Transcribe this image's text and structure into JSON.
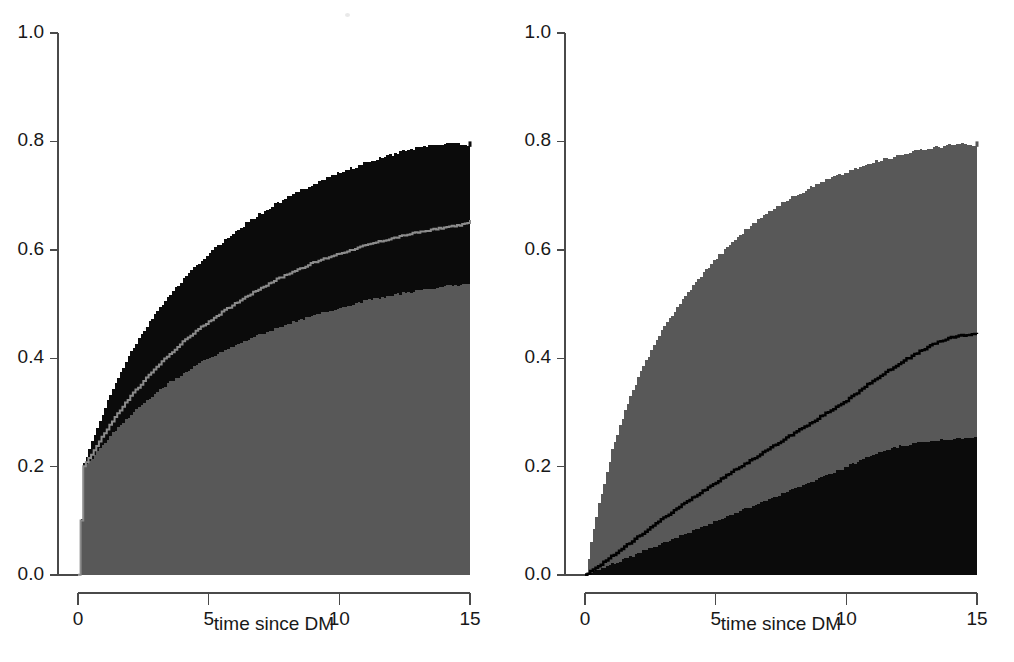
{
  "figure": {
    "width": 1014,
    "height": 662,
    "background": "#ffffff",
    "panel_count": 2
  },
  "colors": {
    "gray_fill": "#585858",
    "black_fill": "#0b0b0b",
    "light_line": "#8c8c8c",
    "dark_line": "#000000",
    "axis": "#4a4a4a",
    "text": "#181818",
    "page": "#ffffff"
  },
  "axes": {
    "y": {
      "label": "",
      "min": 0.0,
      "max": 1.0,
      "ticks": [
        0.0,
        0.2,
        0.4,
        0.6,
        0.8,
        1.0
      ],
      "tick_labels": [
        "0.0",
        "0.2",
        "0.4",
        "0.6",
        "0.8",
        "1.0"
      ]
    },
    "x": {
      "label": "time since DM",
      "min": 0,
      "max": 15,
      "ticks": [
        0,
        5,
        10,
        15
      ],
      "tick_labels": [
        "0",
        "5",
        "10",
        "15"
      ]
    }
  },
  "panels": [
    {
      "name": "left-panel",
      "xlabel": "time since DM",
      "y_tick_labels": [
        "0.0",
        "0.2",
        "0.4",
        "0.6",
        "0.8",
        "1.0"
      ],
      "x_tick_labels": [
        "0",
        "5",
        "10",
        "15"
      ]
    },
    {
      "name": "right-panel",
      "xlabel": "time since DM",
      "y_tick_labels": [
        "0.0",
        "0.2",
        "0.4",
        "0.6",
        "0.8",
        "1.0"
      ],
      "x_tick_labels": [
        "0",
        "5",
        "10",
        "15"
      ]
    }
  ],
  "chart_data": [
    {
      "type": "area",
      "title": "",
      "panel": "left",
      "xlabel": "time since DM",
      "ylabel": "",
      "xlim": [
        0,
        15
      ],
      "ylim": [
        0,
        1
      ],
      "grid": false,
      "legend": "none",
      "x": [
        0,
        0.2,
        0.5,
        1,
        1.5,
        2,
        2.5,
        3,
        3.5,
        4,
        4.5,
        5,
        5.5,
        6,
        6.5,
        7,
        7.5,
        8,
        8.5,
        9,
        9.5,
        10,
        10.5,
        11,
        11.5,
        12,
        12.5,
        13,
        13.5,
        14,
        14.5,
        14.9,
        15
      ],
      "series": [
        {
          "name": "lower-band-gray",
          "role": "gray filled region (lower component)",
          "color": "#585858",
          "values": [
            0.0,
            0.2,
            0.215,
            0.245,
            0.272,
            0.296,
            0.318,
            0.338,
            0.356,
            0.372,
            0.387,
            0.4,
            0.412,
            0.424,
            0.435,
            0.445,
            0.454,
            0.463,
            0.471,
            0.479,
            0.486,
            0.493,
            0.5,
            0.506,
            0.511,
            0.516,
            0.521,
            0.525,
            0.529,
            0.532,
            0.535,
            0.538,
            0.54
          ]
        },
        {
          "name": "upper-envelope-black",
          "role": "upper edge of black band",
          "color": "#0b0b0b",
          "values": [
            0.0,
            0.205,
            0.245,
            0.31,
            0.365,
            0.412,
            0.452,
            0.487,
            0.518,
            0.546,
            0.571,
            0.594,
            0.615,
            0.634,
            0.652,
            0.668,
            0.683,
            0.697,
            0.71,
            0.722,
            0.733,
            0.743,
            0.752,
            0.761,
            0.769,
            0.776,
            0.783,
            0.789,
            0.793,
            0.796,
            0.798,
            0.79,
            0.8
          ]
        },
        {
          "name": "estimate-light-step-curve",
          "role": "thin light-gray step estimate inside black band",
          "color": "#8c8c8c",
          "values": [
            0.0,
            0.202,
            0.222,
            0.262,
            0.298,
            0.33,
            0.358,
            0.384,
            0.408,
            0.43,
            0.45,
            0.468,
            0.485,
            0.501,
            0.516,
            0.53,
            0.543,
            0.555,
            0.566,
            0.576,
            0.585,
            0.593,
            0.601,
            0.608,
            0.615,
            0.621,
            0.627,
            0.632,
            0.637,
            0.641,
            0.645,
            0.648,
            0.655
          ]
        }
      ],
      "notes": "Gray region from 0 up to lower-band values; black band between lower-band and upper-envelope; a thin light step curve (the point estimate) runs through the black band. A short vertical jump occurs at t=15."
    },
    {
      "type": "area",
      "title": "",
      "panel": "right",
      "xlabel": "time since DM",
      "ylabel": "",
      "xlim": [
        0,
        15
      ],
      "ylim": [
        0,
        1
      ],
      "grid": false,
      "legend": "none",
      "x": [
        0,
        0.2,
        0.5,
        1,
        1.5,
        2,
        2.5,
        3,
        3.5,
        4,
        4.5,
        5,
        5.5,
        6,
        6.5,
        7,
        7.5,
        8,
        8.5,
        9,
        9.5,
        10,
        10.5,
        11,
        11.5,
        12,
        12.5,
        13,
        13.5,
        14,
        14.5,
        14.9,
        15
      ],
      "series": [
        {
          "name": "lower-band-black",
          "role": "black filled region (lower component)",
          "color": "#0b0b0b",
          "values": [
            0.0,
            0.004,
            0.01,
            0.02,
            0.03,
            0.04,
            0.05,
            0.06,
            0.07,
            0.08,
            0.09,
            0.1,
            0.11,
            0.12,
            0.13,
            0.14,
            0.15,
            0.16,
            0.17,
            0.18,
            0.19,
            0.2,
            0.212,
            0.222,
            0.23,
            0.237,
            0.242,
            0.246,
            0.249,
            0.251,
            0.253,
            0.254,
            0.255
          ]
        },
        {
          "name": "upper-envelope-gray",
          "role": "upper edge of gray band",
          "color": "#585858",
          "values": [
            0.0,
            0.06,
            0.13,
            0.23,
            0.305,
            0.365,
            0.415,
            0.458,
            0.495,
            0.528,
            0.558,
            0.585,
            0.61,
            0.632,
            0.652,
            0.67,
            0.686,
            0.7,
            0.713,
            0.725,
            0.735,
            0.744,
            0.753,
            0.761,
            0.768,
            0.775,
            0.781,
            0.786,
            0.79,
            0.793,
            0.795,
            0.79,
            0.8
          ]
        },
        {
          "name": "estimate-dark-step-curve",
          "role": "thin black step estimate inside gray band",
          "color": "#000000",
          "values": [
            0.0,
            0.006,
            0.016,
            0.034,
            0.052,
            0.07,
            0.088,
            0.105,
            0.122,
            0.139,
            0.155,
            0.171,
            0.187,
            0.202,
            0.217,
            0.232,
            0.247,
            0.262,
            0.277,
            0.292,
            0.307,
            0.322,
            0.34,
            0.358,
            0.374,
            0.39,
            0.404,
            0.418,
            0.43,
            0.438,
            0.443,
            0.444,
            0.445
          ]
        }
      ],
      "notes": "Black region from 0 up to lower-band values; gray band between lower-band and upper-envelope; a thin black step curve (the point estimate) runs through the gray band. A short vertical jump occurs at t=15."
    }
  ]
}
